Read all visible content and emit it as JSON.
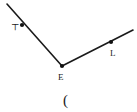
{
  "figure": {
    "kind": "angle-diagram",
    "background_color": "#ffffff",
    "stroke_color": "#1a1a1a",
    "dot_color": "#111111",
    "width": 137,
    "height": 112,
    "points": [
      {
        "id": "left-point",
        "label": "⊤",
        "x": 22,
        "y": 25,
        "label_x": 11,
        "label_y": 30
      },
      {
        "id": "vertex-point",
        "label": "E",
        "x": 62,
        "y": 66,
        "label_x": 58,
        "label_y": 80
      },
      {
        "id": "right-point",
        "label": "L",
        "x": 111,
        "y": 42,
        "label_x": 110,
        "label_y": 56
      }
    ],
    "segments": [
      {
        "id": "left-arm",
        "x1": 7,
        "y1": 4,
        "x2": 62,
        "y2": 66
      },
      {
        "id": "right-arm",
        "x1": 62,
        "y1": 66,
        "x2": 133,
        "y2": 30
      }
    ],
    "annotation": {
      "id": "paren-glyph",
      "text": "(",
      "x": 63,
      "y": 105
    }
  }
}
